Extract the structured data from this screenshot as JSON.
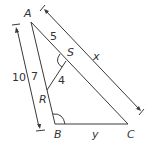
{
  "diagram": {
    "type": "geometry-triangle",
    "stroke_color": "#3a3a3a",
    "points": {
      "A": {
        "label": "A"
      },
      "B": {
        "label": "B"
      },
      "C": {
        "label": "C"
      },
      "S": {
        "label": "S"
      },
      "R": {
        "label": "R"
      }
    },
    "measurements": {
      "AS": "5",
      "AR": "7",
      "RS": "4",
      "AB": "10",
      "AC": "x",
      "BC": "y"
    },
    "angle_marks": [
      "angle-ASR",
      "angle-ABC"
    ]
  }
}
